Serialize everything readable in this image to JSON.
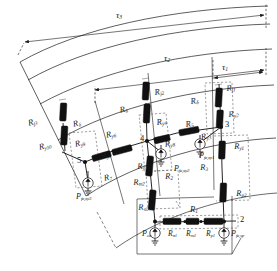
{
  "figure": {
    "kind": "magnetic-equivalent-circuit",
    "colors": {
      "line": "#1a1a1a",
      "resistor_fill": "#111111",
      "dashed": "#3a3a3a",
      "text": "#1a1a1a",
      "background": "#ffffff"
    }
  },
  "dimensions": {
    "pitch_labels": [
      {
        "id": "tau3",
        "text": "τ",
        "sub": "3"
      },
      {
        "id": "tau2",
        "text": "τ",
        "sub": "2"
      },
      {
        "id": "tau1",
        "text": "τ",
        "sub": "1"
      }
    ]
  },
  "nodes": [
    {
      "id": "n2",
      "label": "2"
    },
    {
      "id": "n3",
      "label": "3"
    },
    {
      "id": "n4",
      "label": "4"
    },
    {
      "id": "n5",
      "label": "5"
    }
  ],
  "reluctances": {
    "yoke_joint": [
      {
        "id": "Rj1",
        "text": "R",
        "sub": "j1"
      },
      {
        "id": "Rj2",
        "text": "R",
        "sub": "j2"
      },
      {
        "id": "Rj3",
        "text": "R",
        "sub": "j3"
      }
    ],
    "airgap": [
      {
        "id": "Rd1",
        "text": "R",
        "sub": "δ"
      },
      {
        "id": "Rd2",
        "text": "R",
        "sub": "δ"
      },
      {
        "id": "Rd3",
        "text": "R",
        "sub": "δ"
      }
    ],
    "yoke": [
      {
        "id": "Ry1",
        "text": "R",
        "sub": "y1"
      },
      {
        "id": "Ry2",
        "text": "R",
        "sub": "y2"
      },
      {
        "id": "Ry3",
        "text": "R",
        "sub": "y3"
      },
      {
        "id": "Ry4",
        "text": "R",
        "sub": "y4"
      },
      {
        "id": "Ry5",
        "text": "R",
        "sub": "y5"
      },
      {
        "id": "Ry6",
        "text": "R",
        "sub": "y6"
      },
      {
        "id": "Ry7",
        "text": "R",
        "sub": "y7"
      },
      {
        "id": "Ry8",
        "text": "R",
        "sub": "y8"
      },
      {
        "id": "Ry9",
        "text": "R",
        "sub": "y9"
      },
      {
        "id": "Ry10",
        "text": "R",
        "sub": "y10"
      }
    ],
    "pole": [
      {
        "id": "Rp1",
        "text": "R",
        "sub": "p1"
      },
      {
        "id": "Rp2",
        "text": "R",
        "sub": "p2"
      }
    ],
    "leakage": [
      {
        "id": "Rs1",
        "text": "R",
        "sub": "σ1"
      },
      {
        "id": "Rs2",
        "text": "R",
        "sub": "σ2"
      }
    ],
    "magnet": [
      {
        "id": "Rm1",
        "text": "R",
        "sub": "m1"
      },
      {
        "id": "Rm2",
        "text": "R",
        "sub": "m2"
      }
    ],
    "numbered": [
      {
        "id": "R1",
        "text": "R",
        "sub": "1"
      },
      {
        "id": "R2",
        "text": "R",
        "sub": "2"
      },
      {
        "id": "R3",
        "text": "R",
        "sub": "3"
      },
      {
        "id": "R5",
        "text": "R",
        "sub": "5"
      },
      {
        "id": "R7",
        "text": "R",
        "sub": "7"
      }
    ]
  },
  "sources": [
    {
      "id": "Pcu",
      "text": "P",
      "sub": "cu"
    },
    {
      "id": "Pfesp",
      "text": "P",
      "sub": "fe,sp"
    },
    {
      "id": "Pfexy1",
      "text": "P",
      "sub": "fe,xy1"
    },
    {
      "id": "Pfexy2",
      "text": "P",
      "sub": "fe,xy2"
    },
    {
      "id": "Pfexy3",
      "text": "P",
      "sub": "fe,xy3"
    }
  ]
}
